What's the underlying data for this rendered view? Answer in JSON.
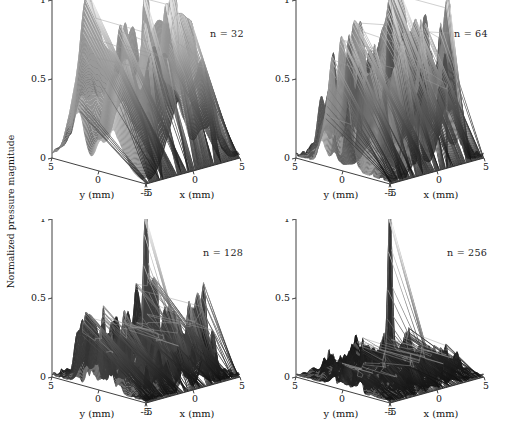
{
  "figure": {
    "shared_ylabel": "Normalized pressure magnitude",
    "background_color": "#ffffff",
    "axis_color": "#2b2b2b",
    "text_color": "#131313"
  },
  "axes": {
    "z_ticks": [
      "0",
      "0.5",
      "1"
    ],
    "z_tick_values": [
      0,
      0.5,
      1
    ],
    "y_ticks": [
      "5",
      "0",
      "-5"
    ],
    "y_tick_values": [
      5,
      0,
      -5
    ],
    "x_ticks": [
      "-5",
      "0",
      "5"
    ],
    "x_tick_values": [
      -5,
      0,
      5
    ],
    "x_label": "x (mm)",
    "y_label": "y (mm)",
    "z_label": "Normalized pressure magnitude"
  },
  "panels": [
    {
      "id": "panel-n32",
      "annotation": "n = 32",
      "n": 32
    },
    {
      "id": "panel-n64",
      "annotation": "n = 64",
      "n": 64
    },
    {
      "id": "panel-n128",
      "annotation": "n = 128",
      "n": 128
    },
    {
      "id": "panel-n256",
      "annotation": "n = 256",
      "n": 256
    }
  ],
  "chart_data": {
    "type": "surface",
    "title": "",
    "xlabel": "x (mm)",
    "ylabel": "y (mm)",
    "zlabel": "Normalized pressure magnitude",
    "xlim": [
      -5,
      5
    ],
    "ylim": [
      -5,
      5
    ],
    "zlim": [
      0,
      1
    ],
    "grid": false,
    "legend": "none",
    "colormap": "grayscale (height-mapped, light at peak, dark at base)",
    "projection": "3d surface, MATLAB default view (az -37.5, el 30)",
    "subplots": [
      {
        "name": "n = 32",
        "n_elements": 32,
        "annotation": "n = 32",
        "main_lobe_peak": 1.0,
        "main_lobe_center": [
          0,
          0
        ],
        "grating_lobe_peaks": [
          0.52,
          0.48,
          0.45,
          0.5,
          0.44,
          0.47,
          0.42
        ],
        "sidelobe_floor": 0.18,
        "description": "Strong regular grating lobes reaching ~0.45-0.5 around the main lobe"
      },
      {
        "name": "n = 64",
        "n_elements": 64,
        "annotation": "n = 64",
        "main_lobe_peak": 1.0,
        "main_lobe_center": [
          0,
          0
        ],
        "grating_lobe_peaks": [
          0.4,
          0.38,
          0.35,
          0.33,
          0.3,
          0.36,
          0.28
        ],
        "sidelobe_floor": 0.15,
        "description": "Many irregular sidelobes in the 0.2-0.4 range, narrower main lobe"
      },
      {
        "name": "n = 128",
        "n_elements": 128,
        "annotation": "n = 128",
        "main_lobe_peak": 1.0,
        "main_lobe_center": [
          0,
          0
        ],
        "grating_lobe_peaks": [
          0.22,
          0.2,
          0.18,
          0.19,
          0.17,
          0.21,
          0.16
        ],
        "sidelobe_floor": 0.1,
        "description": "Sidelobes suppressed to ~0.2, pedestal shoulder around main lobe"
      },
      {
        "name": "n = 256",
        "n_elements": 256,
        "annotation": "n = 256",
        "main_lobe_peak": 1.0,
        "main_lobe_center": [
          0,
          0
        ],
        "grating_lobe_peaks": [
          0.12,
          0.1,
          0.09,
          0.11,
          0.08,
          0.1,
          0.08
        ],
        "sidelobe_floor": 0.06,
        "description": "Smooth low sidelobe floor below ~0.12 with clear central pedestal"
      }
    ]
  }
}
